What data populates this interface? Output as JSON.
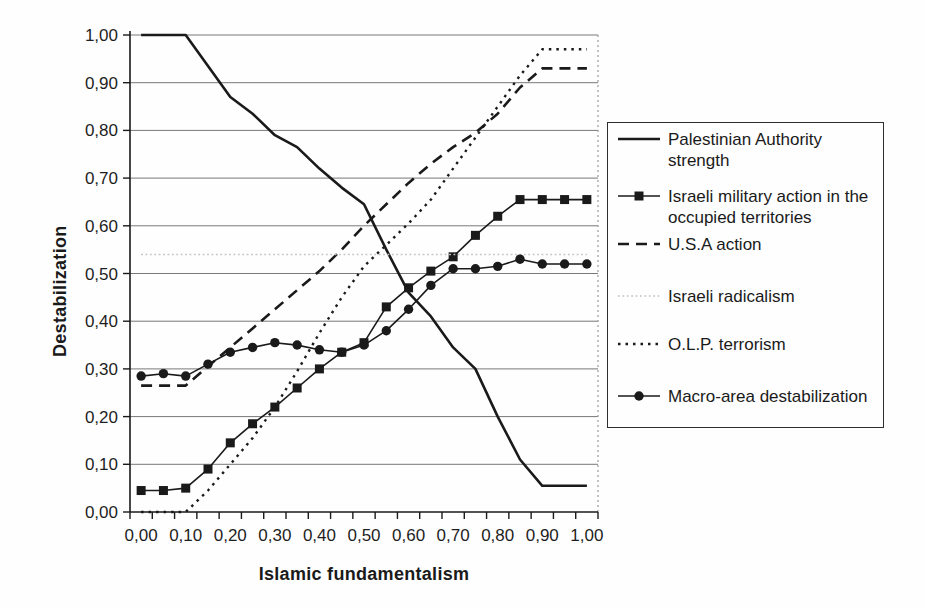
{
  "chart_data": {
    "type": "line",
    "title": "",
    "xlabel": "Islamic fundamentalism",
    "ylabel": "Destabilization",
    "xlim": [
      0,
      1
    ],
    "ylim": [
      0,
      1
    ],
    "grid": "horizontal",
    "legend_position": "right",
    "decimal_separator": ",",
    "x_tick_labels": [
      "0,00",
      "0,10",
      "0,20",
      "0,30",
      "0,40",
      "0,50",
      "0,60",
      "0,70",
      "0,80",
      "0,90",
      "1,00"
    ],
    "y_tick_labels": [
      "0,00",
      "0,10",
      "0,20",
      "0,30",
      "0,40",
      "0,50",
      "0,60",
      "0,70",
      "0,80",
      "0,90",
      "1,00"
    ],
    "categories": [
      0,
      0.05,
      0.1,
      0.15,
      0.2,
      0.25,
      0.3,
      0.35,
      0.4,
      0.45,
      0.5,
      0.55,
      0.6,
      0.65,
      0.7,
      0.75,
      0.8,
      0.85,
      0.9,
      0.95,
      1
    ],
    "series": [
      {
        "name": "Palestinian Authority strength",
        "line": "solid",
        "marker": "none",
        "color": "#1a1a1a",
        "width": 2.6,
        "values": [
          1,
          1,
          1,
          0.935,
          0.87,
          0.835,
          0.79,
          0.765,
          0.72,
          0.68,
          0.645,
          0.55,
          0.46,
          0.41,
          0.345,
          0.3,
          0.2,
          0.11,
          0.055,
          0.055,
          0.055
        ]
      },
      {
        "name": "Israeli military action in the occupied territories",
        "line": "solid",
        "marker": "square",
        "color": "#1a1a1a",
        "width": 1.6,
        "values": [
          0.045,
          0.045,
          0.05,
          0.09,
          0.145,
          0.185,
          0.22,
          0.26,
          0.3,
          0.335,
          0.355,
          0.43,
          0.47,
          0.505,
          0.535,
          0.58,
          0.62,
          0.655,
          0.655,
          0.655,
          0.655
        ]
      },
      {
        "name": "U.S.A action",
        "line": "dashed",
        "marker": "none",
        "color": "#1a1a1a",
        "width": 2.6,
        "values": [
          0.265,
          0.265,
          0.265,
          0.305,
          0.345,
          0.385,
          0.425,
          0.465,
          0.505,
          0.55,
          0.6,
          0.645,
          0.69,
          0.73,
          0.765,
          0.795,
          0.835,
          0.89,
          0.93,
          0.93,
          0.93
        ]
      },
      {
        "name": "Israeli radicalism",
        "line": "fine-dotted",
        "marker": "none",
        "color": "#c4c4c4",
        "width": 1.5,
        "values": [
          0.54,
          0.54,
          0.54,
          0.54,
          0.54,
          0.54,
          0.54,
          0.54,
          0.54,
          0.54,
          0.54,
          0.54,
          0.54,
          0.54,
          0.54,
          0.54,
          0.54,
          0.54,
          0.54,
          0.54,
          0.54
        ]
      },
      {
        "name": "O.L.P. terrorism",
        "line": "dotted",
        "marker": "none",
        "color": "#1a1a1a",
        "width": 2.4,
        "values": [
          0,
          0,
          0,
          0.045,
          0.1,
          0.155,
          0.22,
          0.295,
          0.375,
          0.45,
          0.515,
          0.56,
          0.605,
          0.655,
          0.72,
          0.785,
          0.85,
          0.915,
          0.97,
          0.97,
          0.97
        ]
      },
      {
        "name": "Macro-area destabilization",
        "line": "solid",
        "marker": "circle",
        "color": "#1a1a1a",
        "width": 1.6,
        "values": [
          0.285,
          0.29,
          0.285,
          0.31,
          0.335,
          0.345,
          0.355,
          0.35,
          0.34,
          0.335,
          0.35,
          0.38,
          0.425,
          0.475,
          0.51,
          0.51,
          0.515,
          0.53,
          0.52,
          0.52,
          0.52
        ]
      }
    ]
  }
}
